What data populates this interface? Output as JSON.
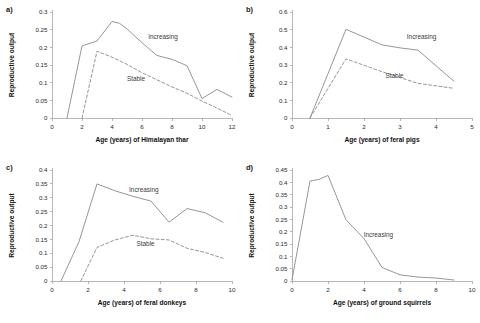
{
  "figure": {
    "panels": [
      {
        "tag": "a)",
        "xlabel": "Age (years) of Himalayan thar",
        "ylabel": "Reproductive output",
        "xlim": [
          0,
          12
        ],
        "ylim": [
          0,
          0.3
        ],
        "xticks": [
          0,
          2,
          4,
          6,
          8,
          10,
          12
        ],
        "xticklabels": [
          "0",
          "2",
          "4",
          "6",
          "8",
          "10",
          "12"
        ],
        "yticks": [
          0,
          0.05,
          0.1,
          0.15,
          0.2,
          0.25,
          0.3
        ],
        "yticklabels": [
          "0",
          "0.05",
          "0.1",
          "0.15",
          "0.2",
          "0.25",
          "0.3"
        ],
        "series": [
          {
            "name": "Increasing",
            "style": "solid",
            "label_x": 7.4,
            "label_y": 0.225,
            "x": [
              1,
              2,
              3,
              4,
              4.5,
              5,
              6,
              7,
              8,
              9,
              10,
              11,
              12
            ],
            "y": [
              0.0,
              0.204,
              0.218,
              0.273,
              0.268,
              0.252,
              0.213,
              0.177,
              0.166,
              0.148,
              0.055,
              0.081,
              0.059
            ]
          },
          {
            "name": "Stable",
            "style": "dashed",
            "label_x": 5.6,
            "label_y": 0.105,
            "x": [
              2,
              3,
              4,
              5,
              6,
              7,
              8,
              9,
              10,
              11,
              12
            ],
            "y": [
              0.0,
              0.189,
              0.172,
              0.152,
              0.128,
              0.108,
              0.088,
              0.07,
              0.048,
              0.028,
              0.007
            ]
          }
        ]
      },
      {
        "tag": "b)",
        "xlabel": "Age (years) of feral pigs",
        "ylabel": "Reproductive output",
        "xlim": [
          0,
          5
        ],
        "ylim": [
          0,
          0.6
        ],
        "xticks": [
          0,
          1,
          2,
          3,
          4,
          5
        ],
        "xticklabels": [
          "0",
          "1",
          "2",
          "3",
          "4",
          "5"
        ],
        "yticks": [
          0,
          0.1,
          0.2,
          0.3,
          0.4,
          0.5,
          0.6
        ],
        "yticklabels": [
          "0",
          "0.1",
          "0.2",
          "0.3",
          "0.4",
          "0.5",
          "0.6"
        ],
        "series": [
          {
            "name": "Increasing",
            "style": "solid",
            "label_x": 3.6,
            "label_y": 0.45,
            "x": [
              0.5,
              1.5,
              2.5,
              3.0,
              3.5,
              4.5
            ],
            "y": [
              0.0,
              0.502,
              0.414,
              0.397,
              0.384,
              0.208
            ]
          },
          {
            "name": "Stable",
            "style": "dashed",
            "label_x": 2.85,
            "label_y": 0.225,
            "x": [
              0.5,
              1.5,
              2.5,
              3.5,
              4.5
            ],
            "y": [
              0.0,
              0.335,
              0.262,
              0.196,
              0.168
            ]
          }
        ]
      },
      {
        "tag": "c)",
        "xlabel": "Age (years) of feral donkeys",
        "ylabel": "Reproductive output",
        "xlim": [
          0,
          10
        ],
        "ylim": [
          0,
          0.4
        ],
        "xticks": [
          0,
          2,
          4,
          6,
          8,
          10
        ],
        "xticklabels": [
          "0",
          "2",
          "4",
          "6",
          "8",
          "10"
        ],
        "yticks": [
          0,
          0.05,
          0.1,
          0.15,
          0.2,
          0.25,
          0.3,
          0.35,
          0.4
        ],
        "yticklabels": [
          "0",
          "0.05",
          "0.1",
          "0.15",
          "0.2",
          "0.25",
          "0.3",
          "0.35",
          "0.4"
        ],
        "series": [
          {
            "name": "Increasing",
            "style": "solid",
            "label_x": 5.1,
            "label_y": 0.322,
            "x": [
              0.5,
              1.5,
              2.5,
              3.5,
              4.5,
              5.5,
              6.5,
              7.5,
              8.5,
              9.5
            ],
            "y": [
              0.0,
              0.142,
              0.35,
              0.325,
              0.305,
              0.288,
              0.212,
              0.261,
              0.246,
              0.212
            ]
          },
          {
            "name": "Stable",
            "style": "dashed",
            "label_x": 5.2,
            "label_y": 0.125,
            "x": [
              1.6,
              2.5,
              3.5,
              4.5,
              5.5,
              6.5,
              7.5,
              8.5,
              9.5
            ],
            "y": [
              0.0,
              0.121,
              0.148,
              0.165,
              0.152,
              0.148,
              0.118,
              0.103,
              0.082
            ]
          }
        ]
      },
      {
        "tag": "d)",
        "xlabel": "Age (years) of ground squirrels",
        "ylabel": "Reproductive output",
        "xlim": [
          0,
          10
        ],
        "ylim": [
          0,
          0.45
        ],
        "xticks": [
          0,
          2,
          4,
          6,
          8,
          10
        ],
        "xticklabels": [
          "0",
          "2",
          "4",
          "6",
          "8",
          "10"
        ],
        "yticks": [
          0,
          0.05,
          0.1,
          0.15,
          0.2,
          0.25,
          0.3,
          0.35,
          0.4,
          0.45
        ],
        "yticklabels": [
          "0",
          "0.05",
          "0.1",
          "0.15",
          "0.2",
          "0.25",
          "0.3",
          "0.35",
          "0.4",
          "0.45"
        ],
        "series": [
          {
            "name": "Increasing",
            "style": "solid",
            "label_x": 4.8,
            "label_y": 0.178,
            "x": [
              0,
              1,
              1.5,
              2,
              3,
              4,
              5,
              6,
              7,
              8,
              9
            ],
            "y": [
              0.005,
              0.405,
              0.412,
              0.428,
              0.248,
              0.172,
              0.055,
              0.025,
              0.016,
              0.012,
              0.004
            ]
          }
        ]
      }
    ]
  },
  "chart_data": {
    "type": "line",
    "title": "",
    "panels": [
      {
        "tag": "a)",
        "species": "Himalayan thar",
        "xlabel": "Age (years) of Himalayan thar",
        "ylabel": "Reproductive output",
        "xlim": [
          0,
          12
        ],
        "ylim": [
          0,
          0.3
        ],
        "grid": false,
        "legend": "inline-annotation",
        "series": [
          {
            "name": "Increasing",
            "style": "solid",
            "x": [
              1,
              2,
              3,
              4,
              4.5,
              5,
              6,
              7,
              8,
              9,
              10,
              11,
              12
            ],
            "values": [
              0.0,
              0.204,
              0.218,
              0.273,
              0.268,
              0.252,
              0.213,
              0.177,
              0.166,
              0.148,
              0.055,
              0.081,
              0.059
            ]
          },
          {
            "name": "Stable",
            "style": "dashed",
            "x": [
              2,
              3,
              4,
              5,
              6,
              7,
              8,
              9,
              10,
              11,
              12
            ],
            "values": [
              0.0,
              0.189,
              0.172,
              0.152,
              0.128,
              0.108,
              0.088,
              0.07,
              0.048,
              0.028,
              0.007
            ]
          }
        ]
      },
      {
        "tag": "b)",
        "species": "feral pigs",
        "xlabel": "Age (years) of feral pigs",
        "ylabel": "Reproductive output",
        "xlim": [
          0,
          5
        ],
        "ylim": [
          0,
          0.6
        ],
        "grid": false,
        "legend": "inline-annotation",
        "series": [
          {
            "name": "Increasing",
            "style": "solid",
            "x": [
              0.5,
              1.5,
              2.5,
              3.0,
              3.5,
              4.5
            ],
            "values": [
              0.0,
              0.502,
              0.414,
              0.397,
              0.384,
              0.208
            ]
          },
          {
            "name": "Stable",
            "style": "dashed",
            "x": [
              0.5,
              1.5,
              2.5,
              3.5,
              4.5
            ],
            "values": [
              0.0,
              0.335,
              0.262,
              0.196,
              0.168
            ]
          }
        ]
      },
      {
        "tag": "c)",
        "species": "feral donkeys",
        "xlabel": "Age (years) of feral donkeys",
        "ylabel": "Reproductive output",
        "xlim": [
          0,
          10
        ],
        "ylim": [
          0,
          0.4
        ],
        "grid": false,
        "legend": "inline-annotation",
        "series": [
          {
            "name": "Increasing",
            "style": "solid",
            "x": [
              0.5,
              1.5,
              2.5,
              3.5,
              4.5,
              5.5,
              6.5,
              7.5,
              8.5,
              9.5
            ],
            "values": [
              0.0,
              0.142,
              0.35,
              0.325,
              0.305,
              0.288,
              0.212,
              0.261,
              0.246,
              0.212
            ]
          },
          {
            "name": "Stable",
            "style": "dashed",
            "x": [
              1.6,
              2.5,
              3.5,
              4.5,
              5.5,
              6.5,
              7.5,
              8.5,
              9.5
            ],
            "values": [
              0.0,
              0.121,
              0.148,
              0.165,
              0.152,
              0.148,
              0.118,
              0.103,
              0.082
            ]
          }
        ]
      },
      {
        "tag": "d)",
        "species": "ground squirrels",
        "xlabel": "Age (years) of ground squirrels",
        "ylabel": "Reproductive output",
        "xlim": [
          0,
          10
        ],
        "ylim": [
          0,
          0.45
        ],
        "grid": false,
        "legend": "inline-annotation",
        "series": [
          {
            "name": "Increasing",
            "style": "solid",
            "x": [
              0,
              1,
              1.5,
              2,
              3,
              4,
              5,
              6,
              7,
              8,
              9
            ],
            "values": [
              0.005,
              0.405,
              0.412,
              0.428,
              0.248,
              0.172,
              0.055,
              0.025,
              0.016,
              0.012,
              0.004
            ]
          }
        ]
      }
    ]
  }
}
